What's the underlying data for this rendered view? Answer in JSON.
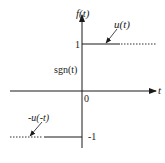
{
  "diagram": {
    "type": "signum-function-plot",
    "axes": {
      "y_label": "f(t)",
      "x_label": "t",
      "origin_label": "0"
    },
    "levels": {
      "positive_label": "1",
      "negative_label": "-1"
    },
    "function_label": "sgn(t)",
    "annotations": {
      "positive_part": "u(t)",
      "negative_part": "-u(-t)"
    },
    "colors": {
      "line": "#1a1a1a",
      "background": "#ffffff"
    }
  }
}
